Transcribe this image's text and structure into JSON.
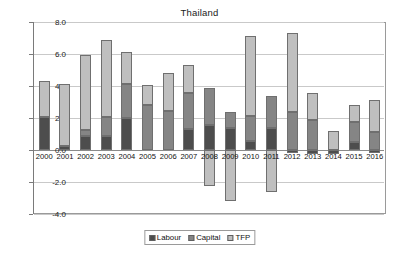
{
  "chart_data": {
    "type": "bar",
    "title": "Thailand",
    "subtitle": "",
    "xlabel": "",
    "ylabel": "",
    "stacked": true,
    "grid": true,
    "legend_position": "bottom",
    "ylim": [
      -4.0,
      8.0
    ],
    "ytick_labels": [
      "8.0",
      "6.0",
      "4.0",
      "2.0",
      "0.0",
      "-2.0",
      "-4.0"
    ],
    "ytick_values": [
      8.0,
      6.0,
      4.0,
      2.0,
      0.0,
      -2.0,
      -4.0
    ],
    "categories": [
      "2000",
      "2001",
      "2002",
      "2003",
      "2004",
      "2005",
      "2006",
      "2007",
      "2008",
      "2009",
      "2010",
      "2011",
      "2012",
      "2013",
      "2014",
      "2015",
      "2016"
    ],
    "series": [
      {
        "name": "Labour",
        "color": "#4d4d4d",
        "values": [
          2.05,
          0.25,
          0.9,
          0.9,
          2.0,
          0.0,
          0.0,
          1.3,
          1.55,
          1.4,
          0.55,
          1.4,
          -0.2,
          -0.25,
          -0.25,
          0.5,
          -0.2
        ]
      },
      {
        "name": "Capital",
        "color": "#858585",
        "values": [
          0.0,
          0.0,
          0.35,
          1.15,
          2.15,
          2.8,
          2.45,
          2.25,
          2.3,
          1.0,
          1.6,
          1.95,
          2.35,
          1.9,
          0.0,
          1.25,
          1.15
        ]
      },
      {
        "name": "TFP",
        "color": "#bfbfbf",
        "values": [
          2.25,
          3.85,
          4.7,
          4.85,
          1.95,
          1.25,
          2.35,
          1.75,
          -2.25,
          -3.2,
          5.0,
          -2.65,
          4.95,
          1.65,
          1.2,
          1.05,
          1.95
        ]
      }
    ],
    "totals_positive": [
      4.3,
      4.1,
      5.95,
      6.9,
      6.1,
      4.05,
      4.8,
      5.3,
      3.85,
      2.4,
      7.15,
      3.35,
      7.1,
      3.3,
      1.2,
      2.8,
      3.1
    ]
  },
  "legend": {
    "items": [
      {
        "label": "Labour",
        "swatch": "labour-swatch-icon"
      },
      {
        "label": "Capital",
        "swatch": "capital-swatch-icon"
      },
      {
        "label": "TFP",
        "swatch": "tfp-swatch-icon"
      }
    ]
  }
}
